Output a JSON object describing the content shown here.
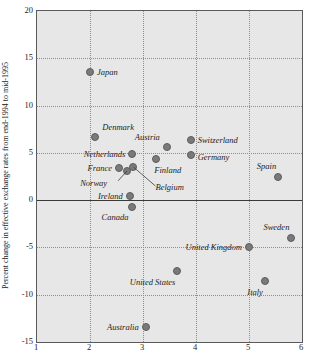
{
  "chart_data": {
    "type": "scatter",
    "title": "",
    "xlabel": "",
    "ylabel": "Percent change in effective exchange rates from end-1994 to mid-1995",
    "xlim": [
      1,
      6
    ],
    "ylim": [
      -15,
      20
    ],
    "xticks": [
      "1",
      "2",
      "3",
      "4",
      "5",
      "6"
    ],
    "yticks": [
      "20",
      "15",
      "10",
      "5",
      "0",
      "-5",
      "-10",
      "-15"
    ],
    "grid": true,
    "legend": "none",
    "zero_reference_line": 0,
    "points": [
      {
        "label": "Japan",
        "x": 2.0,
        "y": 13.6,
        "label_side": "right"
      },
      {
        "label": "Denmark",
        "x": 2.1,
        "y": 6.7,
        "label_side": "right"
      },
      {
        "label": "Netherlands",
        "x": 2.8,
        "y": 4.9,
        "label_side": "left"
      },
      {
        "label": "France",
        "x": 2.55,
        "y": 3.35,
        "label_side": "left"
      },
      {
        "label": "Norway",
        "x": 2.7,
        "y": 3.1,
        "label_side": "left"
      },
      {
        "label": "Belgium",
        "x": 2.82,
        "y": 3.5,
        "label_side": "right"
      },
      {
        "label": "Ireland",
        "x": 2.75,
        "y": 0.4,
        "label_side": "left"
      },
      {
        "label": "Canada",
        "x": 2.8,
        "y": -0.7,
        "label_side": "left"
      },
      {
        "label": "Austria",
        "x": 3.45,
        "y": 5.6,
        "label_side": "left"
      },
      {
        "label": "Finland",
        "x": 3.25,
        "y": 4.35,
        "label_side": "right"
      },
      {
        "label": "Switzerland",
        "x": 3.9,
        "y": 6.4,
        "label_side": "right"
      },
      {
        "label": "Germany",
        "x": 3.9,
        "y": 4.75,
        "label_side": "right"
      },
      {
        "label": "Spain",
        "x": 5.55,
        "y": 2.4,
        "label_side": "left"
      },
      {
        "label": "United Kingdom",
        "x": 5.0,
        "y": -5.0,
        "label_side": "left"
      },
      {
        "label": "Sweden",
        "x": 5.8,
        "y": -4.0,
        "label_side": "left"
      },
      {
        "label": "United States",
        "x": 3.65,
        "y": -7.5,
        "label_side": "left"
      },
      {
        "label": "Italy",
        "x": 5.3,
        "y": -8.5,
        "label_side": "left"
      },
      {
        "label": "Australia",
        "x": 3.05,
        "y": -13.4,
        "label_side": "left"
      }
    ],
    "colors": {
      "marker_fill": "#7a7a7a",
      "marker_edge": "#5d5d5d",
      "plot_background": "#e7e7e7",
      "grid": "#8e8e8e",
      "axis": "#5a5a5a",
      "text": "#1d1d1d"
    }
  }
}
